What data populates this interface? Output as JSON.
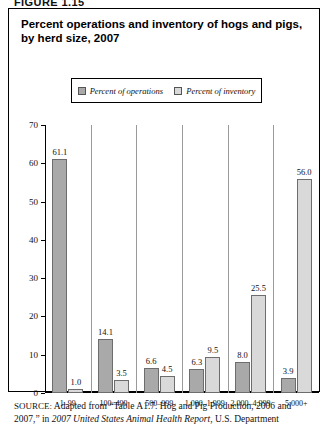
{
  "figure_label": "FIGURE 1.15",
  "chart_title": "Percent operations and inventory of hogs and pigs, by herd size, 2007",
  "legend": {
    "items": [
      {
        "label": "Percent of operations",
        "color": "#a9a9a9",
        "swatch_icon": "legend-swatch-icon"
      },
      {
        "label": "Percent of inventory",
        "color": "#d9d9d9",
        "swatch_icon": "legend-swatch-icon"
      }
    ]
  },
  "source": {
    "prefix": "SOURCE:",
    "line1_a": " Adapted from “Table A1.7. Hog and Pig Production, 2006 and",
    "line2_a": "2007,” in ",
    "line2_italic": "2007 United States Animal Health Report",
    "line2_b": ", U.S. Department"
  },
  "chart_data": {
    "type": "bar",
    "title": "Percent operations and inventory of hogs and pigs, by herd size, 2007",
    "xlabel": "",
    "ylabel": "",
    "ylim": [
      0,
      70
    ],
    "yticks": [
      0,
      10,
      20,
      30,
      40,
      50,
      60,
      70
    ],
    "ytick_labels": [
      "0",
      "10",
      "20",
      "30",
      "40",
      "50",
      "60",
      "70"
    ],
    "grid": false,
    "legend_position": "top-center",
    "categories": [
      "1–99",
      "100–499",
      "500–999",
      "1,000–1,999",
      "2,000–4,999",
      "5,000+"
    ],
    "series": [
      {
        "name": "Percent of operations",
        "color": "#a9a9a9",
        "values": [
          61.1,
          14.1,
          6.6,
          6.3,
          8.0,
          3.9
        ],
        "value_labels": [
          "61.1",
          "14.1",
          "6.6",
          "6.3",
          "8.0",
          "3.9"
        ]
      },
      {
        "name": "Percent of inventory",
        "color": "#d9d9d9",
        "values": [
          1.0,
          3.5,
          4.5,
          9.5,
          25.5,
          56.0
        ],
        "value_labels": [
          "1.0",
          "3.5",
          "4.5",
          "9.5",
          "25.5",
          "56.0"
        ]
      }
    ]
  }
}
